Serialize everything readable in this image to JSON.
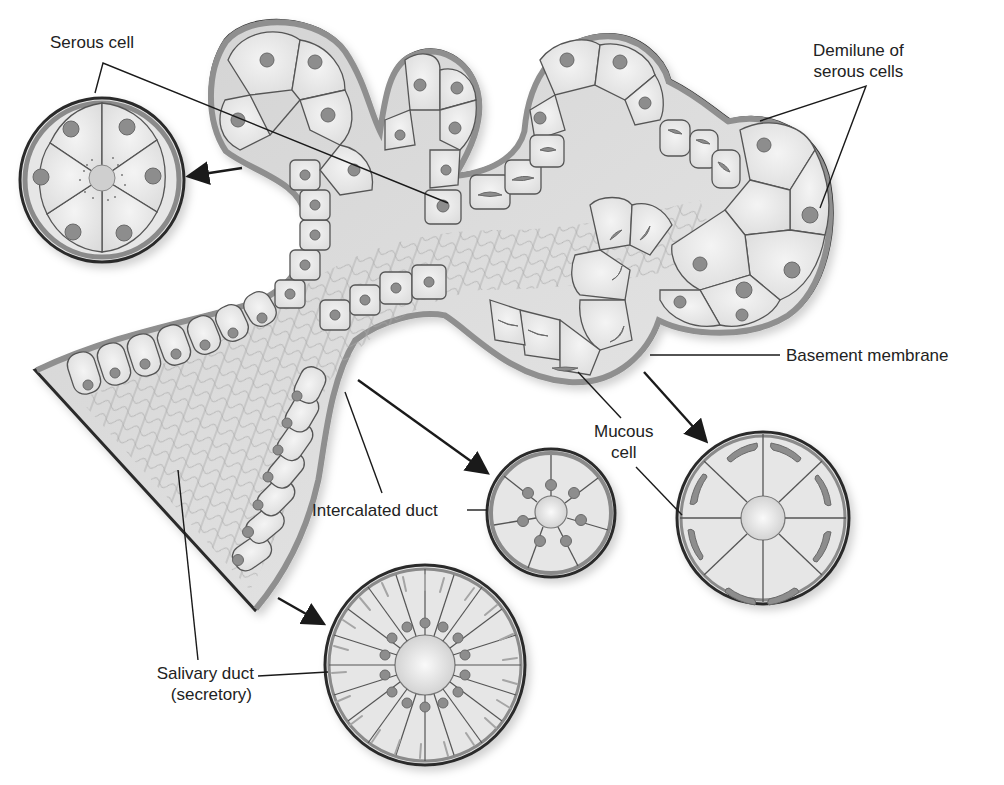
{
  "diagram": {
    "colors": {
      "background": "#ffffff",
      "cell_fill": "#e9e9e9",
      "basement_membrane": "#8a8a8a",
      "nucleus": "#8d8d8d",
      "outline": "#2b2b2b",
      "leader_line": "#1a1a1a"
    },
    "labels": {
      "serous_cell": "Serous cell",
      "demilune_line1": "Demilune of",
      "demilune_line2": "serous cells",
      "basement_membrane": "Basement membrane",
      "mucous_line1": "Mucous",
      "mucous_line2": "cell",
      "intercalated_duct": "Intercalated duct",
      "salivary_duct_line1": "Salivary duct",
      "salivary_duct_line2": "(secretory)"
    },
    "insets": [
      {
        "name": "serous-acinus-cross-section",
        "cells": 5,
        "nucleus_type": "round",
        "feature": "secretory granules near lumen"
      },
      {
        "name": "intercalated-duct-cross-section",
        "cells": 7,
        "nucleus_type": "round"
      },
      {
        "name": "mucous-acinus-cross-section",
        "cells": 8,
        "nucleus_type": "flattened basal"
      },
      {
        "name": "salivary-duct-cross-section",
        "cells": 18,
        "nucleus_type": "round",
        "feature": "basal striations"
      }
    ]
  }
}
